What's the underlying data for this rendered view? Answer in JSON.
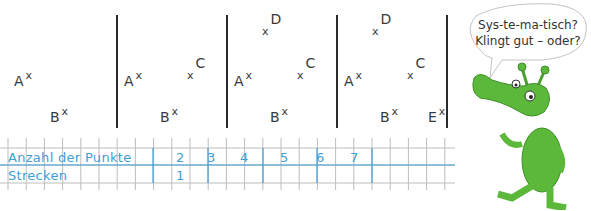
{
  "panels": [
    {
      "points": [
        {
          "label": "A",
          "x": 14,
          "y": 74,
          "side": "after"
        },
        {
          "label": "B",
          "x": 50,
          "y": 110,
          "side": "after"
        }
      ]
    },
    {
      "points": [
        {
          "label": "A",
          "x": 124,
          "y": 74,
          "side": "after"
        },
        {
          "label": "B",
          "x": 160,
          "y": 110,
          "side": "after"
        },
        {
          "label": "C",
          "x": 187,
          "y": 64,
          "side": "before"
        }
      ]
    },
    {
      "points": [
        {
          "label": "A",
          "x": 234,
          "y": 74,
          "side": "after"
        },
        {
          "label": "B",
          "x": 270,
          "y": 110,
          "side": "after"
        },
        {
          "label": "C",
          "x": 297,
          "y": 64,
          "side": "before"
        },
        {
          "label": "D",
          "x": 262,
          "y": 20,
          "side": "before"
        }
      ]
    },
    {
      "points": [
        {
          "label": "A",
          "x": 344,
          "y": 74,
          "side": "after"
        },
        {
          "label": "B",
          "x": 380,
          "y": 110,
          "side": "after"
        },
        {
          "label": "C",
          "x": 407,
          "y": 64,
          "side": "before"
        },
        {
          "label": "D",
          "x": 372,
          "y": 20,
          "side": "before"
        },
        {
          "label": "E",
          "x": 428,
          "y": 110,
          "side": "after"
        }
      ]
    }
  ],
  "table": {
    "row1_label": "Anzahl der Punkte",
    "row2_label": "Strecken",
    "points_values": [
      "2",
      "3",
      "4",
      "5",
      "6",
      "7"
    ],
    "segments_values": [
      "1",
      "",
      "",
      "",
      "",
      ""
    ]
  },
  "speech_bubble": {
    "line1": "Sys-te-ma-tisch?",
    "line2": "Klingt gut – oder?"
  },
  "mascot": {
    "icon": "green-alien-mascot-icon",
    "color": "#5cb83a"
  },
  "colors": {
    "ink_blue": "#3d9fd6",
    "grid_gray": "#b0b0b0"
  }
}
